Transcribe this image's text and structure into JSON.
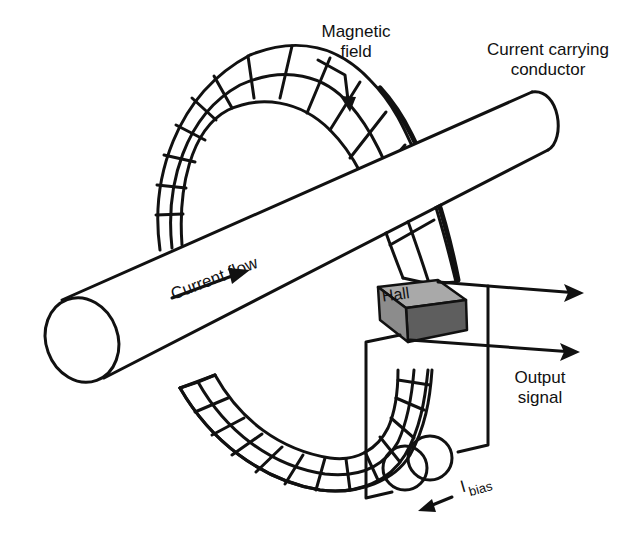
{
  "diagram": {
    "labels": {
      "magnetic_field": [
        "Magnetic",
        "field"
      ],
      "conductor": [
        "Current carrying",
        "conductor"
      ],
      "current_flow": "Current flow",
      "hall": "Hall",
      "output_signal": [
        "Output",
        "signal"
      ],
      "ibias_main": "I",
      "ibias_sub": "bias"
    },
    "components": [
      {
        "id": "conductor",
        "kind": "cylinder",
        "label": "Current carrying conductor"
      },
      {
        "id": "core",
        "kind": "segmented toroidal magnetic core"
      },
      {
        "id": "hall-element",
        "kind": "block in core gap",
        "label": "Hall"
      },
      {
        "id": "bias-source",
        "kind": "current source symbol (two overlapping circles)",
        "label": "I bias"
      },
      {
        "id": "output-leads",
        "kind": "two arrows to the right",
        "label": "Output signal"
      }
    ],
    "arrows": [
      {
        "id": "field-arrow",
        "meaning": "magnetic field direction along core (clockwise)"
      },
      {
        "id": "current-arrow",
        "meaning": "current flow direction along conductor"
      },
      {
        "id": "ibias-arrow",
        "meaning": "bias current direction"
      }
    ],
    "colors": {
      "line": "#111111",
      "hall_top": "#a9a9a9",
      "hall_front": "#5e5e5e",
      "hall_side": "#8c8c8c",
      "background": "#ffffff"
    }
  }
}
